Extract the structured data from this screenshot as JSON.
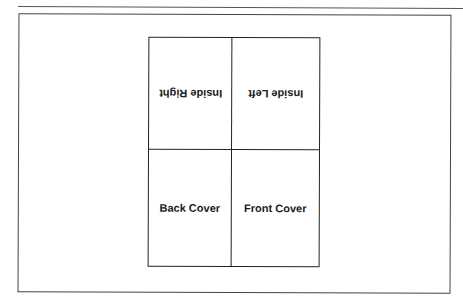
{
  "diagram": {
    "type": "folded-card-layout",
    "panels": [
      {
        "id": "inside-right",
        "label": "Inside Right",
        "row": 1,
        "col": 1,
        "upside_down": true
      },
      {
        "id": "inside-left",
        "label": "Inside Left",
        "row": 1,
        "col": 2,
        "upside_down": true
      },
      {
        "id": "back-cover",
        "label": "Back Cover",
        "row": 2,
        "col": 1,
        "upside_down": false
      },
      {
        "id": "front-cover",
        "label": "Front Cover",
        "row": 2,
        "col": 2,
        "upside_down": false
      }
    ]
  },
  "colors": {
    "line": "#222222",
    "text": "#1a1a1a",
    "background": "#ffffff"
  }
}
